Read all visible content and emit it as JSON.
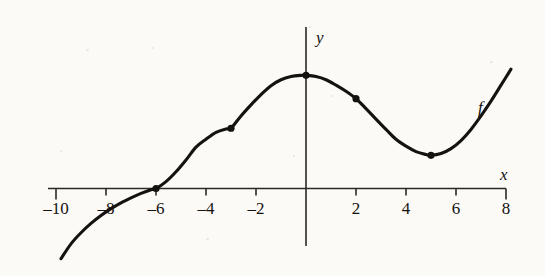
{
  "figure": {
    "background_color": "#fbfaf7",
    "ink_color": "#14110f",
    "curve_label": "f",
    "x_axis_label": "x",
    "y_axis_label": "y"
  },
  "chart_data": {
    "type": "line",
    "title": "",
    "subtitle": "",
    "xlabel": "x",
    "ylabel": "y",
    "grid": false,
    "legend": false,
    "legend_position": "none",
    "series_label": "f",
    "xlim": [
      -10,
      8
    ],
    "ylim": [
      -4.2,
      4.6
    ],
    "x_ticks": [
      -10,
      -8,
      -6,
      -4,
      -2,
      0,
      2,
      4,
      6,
      8
    ],
    "x_tick_labels": [
      "–10",
      "–8",
      "–6",
      "–4",
      "–2",
      "",
      "2",
      "4",
      "6",
      "8"
    ],
    "x_tick_labels_shown": [
      "–10",
      "–6",
      "–4",
      "–2",
      "2",
      "4",
      "6",
      "8"
    ],
    "y_ticks": [],
    "y_tick_labels": [],
    "annotations": [
      {
        "text": "f",
        "x": 7.2,
        "y": 3.3,
        "italic": true
      },
      {
        "text": "x",
        "x": 8.2,
        "y": 0.75,
        "italic": true
      },
      {
        "text": "y",
        "x": 0.5,
        "y": 4.3,
        "italic": true
      }
    ],
    "marked_points": [
      {
        "x": -6,
        "y": 0,
        "label": "x-intercept / inflection"
      },
      {
        "x": -3,
        "y": 2.45,
        "label": "inflection"
      },
      {
        "x": 0,
        "y": 4.6,
        "label": "local maximum"
      },
      {
        "x": 2,
        "y": 3.65,
        "label": "inflection"
      },
      {
        "x": 5,
        "y": 1.35,
        "label": "local minimum"
      }
    ],
    "x": [
      -9.8,
      -9.4,
      -9.0,
      -8.6,
      -8.2,
      -7.8,
      -7.4,
      -7.0,
      -6.6,
      -6.2,
      -6.0,
      -5.6,
      -5.2,
      -4.8,
      -4.4,
      -4.0,
      -3.6,
      -3.2,
      -3.0,
      -2.6,
      -2.2,
      -1.8,
      -1.4,
      -1.0,
      -0.6,
      -0.2,
      0.0,
      0.4,
      0.8,
      1.2,
      1.6,
      2.0,
      2.4,
      2.8,
      3.2,
      3.6,
      4.0,
      4.4,
      4.8,
      5.0,
      5.4,
      5.8,
      6.2,
      6.6,
      7.0,
      7.4,
      7.8,
      8.2
    ],
    "y": [
      -2.85,
      -2.25,
      -1.8,
      -1.42,
      -1.1,
      -0.82,
      -0.58,
      -0.38,
      -0.2,
      -0.05,
      0.0,
      0.28,
      0.68,
      1.16,
      1.68,
      2.0,
      2.28,
      2.42,
      2.45,
      2.95,
      3.4,
      3.82,
      4.18,
      4.42,
      4.55,
      4.6,
      4.6,
      4.55,
      4.42,
      4.2,
      3.95,
      3.65,
      3.25,
      2.82,
      2.4,
      2.0,
      1.72,
      1.5,
      1.38,
      1.35,
      1.42,
      1.62,
      1.95,
      2.4,
      2.95,
      3.55,
      4.2,
      4.85
    ]
  }
}
